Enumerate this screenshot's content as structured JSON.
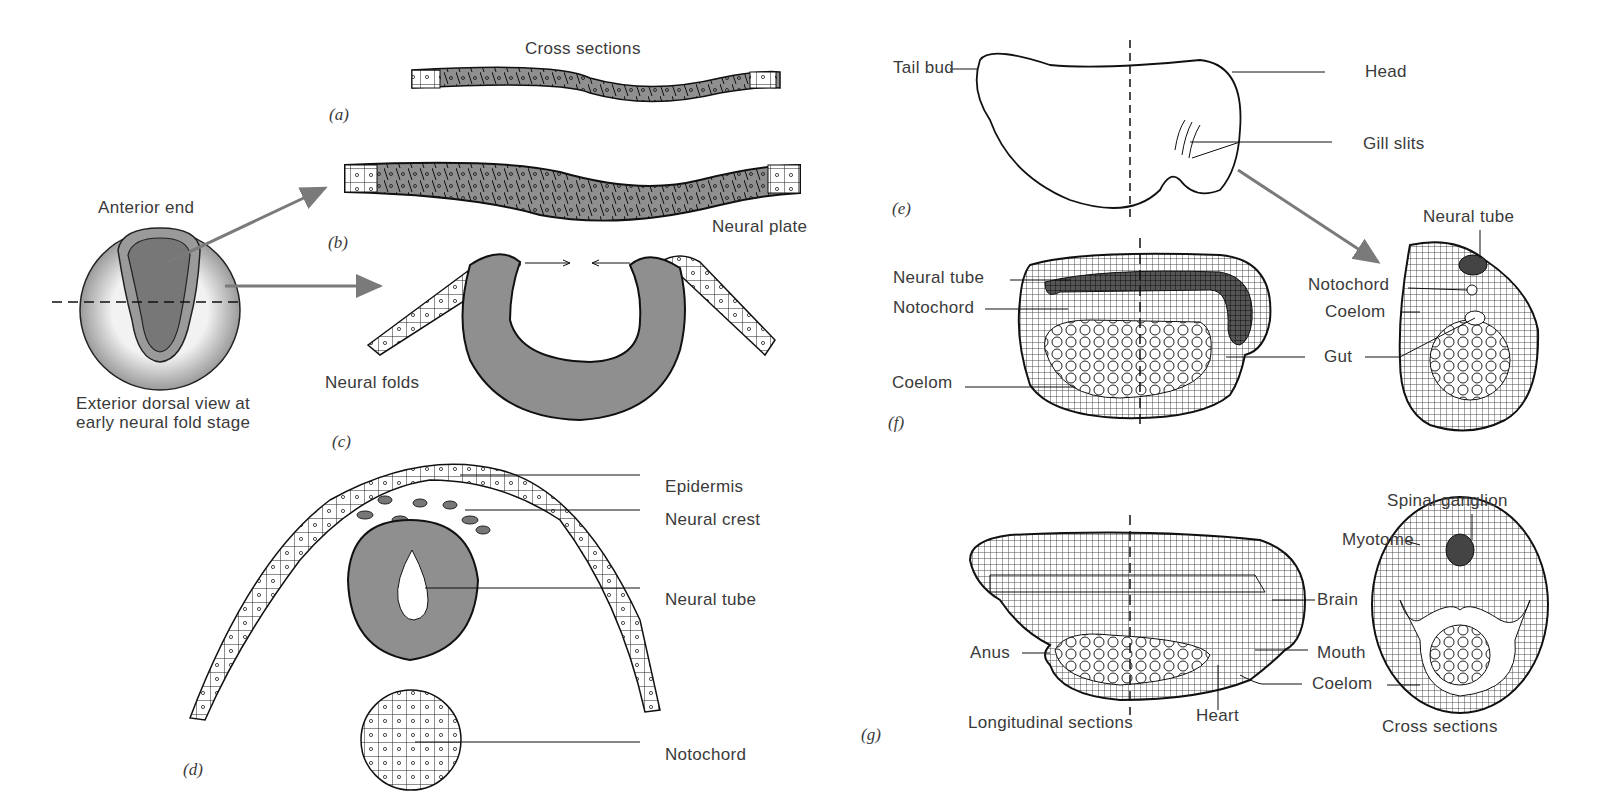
{
  "figure": {
    "panels": {
      "a": "(a)",
      "b": "(b)",
      "c": "(c)",
      "d": "(d)",
      "e": "(e)",
      "f": "(f)",
      "g": "(g)"
    },
    "left": {
      "cross_sections_title": "Cross sections",
      "neural_plate": "Neural plate",
      "anterior_end": "Anterior end",
      "dorsal_view_caption": "Exterior dorsal view at early neural fold stage",
      "neural_folds": "Neural folds",
      "d_labels": [
        "Epidermis",
        "Neural crest",
        "Neural tube",
        "Notochord"
      ]
    },
    "right_e": {
      "tail_bud": "Tail bud",
      "head": "Head",
      "gill_slits": "Gill slits"
    },
    "right_f": {
      "longitudinal_labels": [
        "Neural tube",
        "Notochord",
        "Coelom"
      ],
      "gut": "Gut",
      "cross_labels": {
        "neural_tube": "Neural tube",
        "notochord": "Notochord",
        "coelom": "Coelom"
      }
    },
    "right_g": {
      "anus": "Anus",
      "brain": "Brain",
      "mouth": "Mouth",
      "coelom": "Coelom",
      "heart": "Heart",
      "longitudinal_sections": "Longitudinal sections",
      "spinal_ganglion": "Spinal ganglion",
      "myotome": "Myotome",
      "cross_sections": "Cross sections"
    },
    "colors": {
      "tissue_gray": "#8f8f8f",
      "outline": "#1a1a1a",
      "arrow_gray": "#7a7a7a",
      "label_text": "#3a3a3a"
    }
  }
}
